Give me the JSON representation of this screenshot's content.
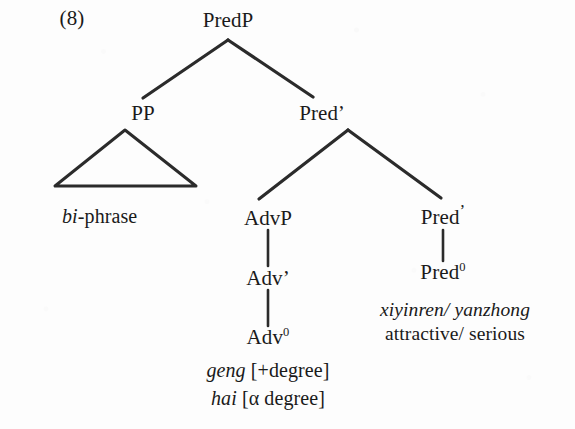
{
  "figure": {
    "example_number": "(8)",
    "ink_color": "#2b2b2b",
    "background_color": "#fdfdfd"
  },
  "nodes": {
    "predp": {
      "label": "PredP",
      "x": 228,
      "y": 20
    },
    "pp": {
      "label": "PP",
      "x": 143,
      "y": 113
    },
    "predbar1": {
      "label": "Pred",
      "prime": "’",
      "x": 322,
      "y": 113
    },
    "advp": {
      "label": "AdvP",
      "x": 268,
      "y": 218
    },
    "predbar2": {
      "label": "Pred",
      "prime": "’",
      "x": 443,
      "y": 217
    },
    "advbar": {
      "label": "Adv’",
      "x": 268,
      "y": 278
    },
    "adv0": {
      "label": "Adv",
      "sup": "0",
      "x": 268,
      "y": 337
    },
    "pred0": {
      "label": "Pred",
      "sup": "0",
      "x": 443,
      "y": 272
    }
  },
  "terminals": {
    "bi_phrase": {
      "italic_part": "bi",
      "roman_part": "-phrase",
      "x": 62,
      "y": 216
    },
    "geng": {
      "italic_part": "geng",
      "roman_part": " [+degree]",
      "x": 268,
      "y": 370
    },
    "hai": {
      "italic_part": "hai",
      "roman_part": " [α degree]",
      "x": 268,
      "y": 398
    }
  },
  "glosses": {
    "pred_romanization": {
      "text": "xiyinren/ yanzhong",
      "x": 455,
      "y": 310
    },
    "pred_translation": {
      "text": "attractive/ serious",
      "x": 455,
      "y": 334
    }
  },
  "edges": [
    {
      "name": "predp-to-pp",
      "x1": 228,
      "y1": 40,
      "x2": 143,
      "y2": 98,
      "width": 3.2
    },
    {
      "name": "predp-to-predbar",
      "x1": 228,
      "y1": 40,
      "x2": 313,
      "y2": 97,
      "width": 3.2
    },
    {
      "name": "predbar-to-advp",
      "x1": 348,
      "y1": 130,
      "x2": 259,
      "y2": 199,
      "width": 3.2
    },
    {
      "name": "predbar-to-predbar2",
      "x1": 348,
      "y1": 130,
      "x2": 441,
      "y2": 198,
      "width": 3.2
    },
    {
      "name": "advp-to-advbar",
      "x1": 268,
      "y1": 230,
      "x2": 268,
      "y2": 266,
      "width": 2.6
    },
    {
      "name": "advbar-to-adv0",
      "x1": 268,
      "y1": 290,
      "x2": 268,
      "y2": 326,
      "width": 2.6
    },
    {
      "name": "predbar2-to-pred0",
      "x1": 443,
      "y1": 230,
      "x2": 443,
      "y2": 261,
      "width": 2.6
    }
  ],
  "triangle": {
    "name": "pp-triangle",
    "apex_x": 125,
    "apex_y": 130,
    "left_x": 55,
    "right_x": 196,
    "base_y": 186,
    "width": 3.0
  }
}
